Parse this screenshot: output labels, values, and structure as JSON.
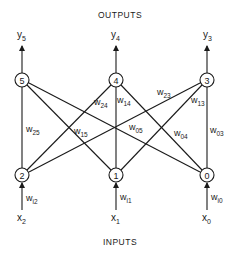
{
  "title_top": "OUTPUTS",
  "title_bottom": "INPUTS",
  "output_nodes": [
    {
      "id": "5",
      "x": 22,
      "y": 80,
      "output_label": "y",
      "output_sub": "5"
    },
    {
      "id": "4",
      "x": 116,
      "y": 80,
      "output_label": "y",
      "output_sub": "4"
    },
    {
      "id": "3",
      "x": 207,
      "y": 80,
      "output_label": "y",
      "output_sub": "3"
    }
  ],
  "input_nodes": [
    {
      "id": "2",
      "x": 22,
      "y": 175,
      "input_label": "x",
      "input_sub": "2",
      "weight": "w",
      "weight_sub": "i2"
    },
    {
      "id": "1",
      "x": 116,
      "y": 175,
      "input_label": "x",
      "input_sub": "1",
      "weight": "w",
      "weight_sub": "i1"
    },
    {
      "id": "0",
      "x": 207,
      "y": 175,
      "input_label": "x",
      "input_sub": "0",
      "weight": "w",
      "weight_sub": "i0"
    }
  ],
  "edge_weights": [
    {
      "label": "w",
      "sub": "25"
    },
    {
      "label": "w",
      "sub": "24"
    },
    {
      "label": "w",
      "sub": "14"
    },
    {
      "label": "w",
      "sub": "23"
    },
    {
      "label": "w",
      "sub": "13"
    },
    {
      "label": "w",
      "sub": "15"
    },
    {
      "label": "w",
      "sub": "05"
    },
    {
      "label": "w",
      "sub": "04"
    },
    {
      "label": "w",
      "sub": "03"
    }
  ]
}
